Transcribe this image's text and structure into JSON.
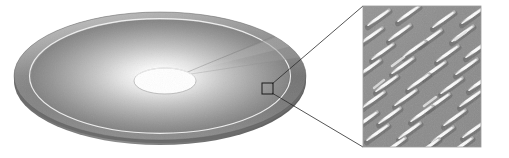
{
  "figure": {
    "caption": "",
    "background_color": "#ffffff",
    "width": 509,
    "height": 158
  },
  "disc": {
    "label": "optical disc",
    "center_x": 160,
    "center_y": 76,
    "radius_x": 146,
    "radius_y": 64,
    "edge_thickness": 5,
    "rim": {
      "label": "outer rim band",
      "color_dark": "#6e6e6e",
      "color_light": "#9a9a9a",
      "inner_ratio": 0.88
    },
    "track_ring": {
      "label": "lead-in ring line",
      "color": "#f2f2f2",
      "radius_ratio": 0.87,
      "stroke_width": 1
    },
    "surface": {
      "label": "recording surface",
      "color_highlight": "#fcfcfc",
      "color_mid": "#c8c8c8",
      "color_edge": "#7a7a7a"
    },
    "hub_hole": {
      "label": "center spindle hole",
      "center_x": 165,
      "center_y": 81,
      "radius_x": 31,
      "radius_y": 13,
      "fill": "#ffffff",
      "stroke": "#b8b8b8"
    },
    "sector_wedge": {
      "label": "highlighted data sector",
      "fill": "#b4b4b4",
      "opacity": 0.55
    }
  },
  "callout": {
    "marker": {
      "label": "magnified region marker",
      "x": 262,
      "y": 83,
      "width": 11,
      "height": 11,
      "stroke": "#1a1a1a",
      "fill": "none"
    },
    "leader_lines": {
      "label": "callout leader lines",
      "stroke": "#2a2a2a",
      "stroke_width": 0.8
    }
  },
  "inset": {
    "label": "electron micrograph of recorded marks",
    "x": 363,
    "y": 6,
    "width": 118,
    "height": 141,
    "background_color": "#8e8e8e",
    "mark_color": "#f0f0f0",
    "mark_shadow_color": "#646464",
    "border_color": "#9a9a9a",
    "pattern": {
      "type": "diagonal recorded marks",
      "mark_angle_deg": -45,
      "rows": 9,
      "columns": 5,
      "mark_length": 22,
      "mark_width": 3.2,
      "row_spacing": 16,
      "column_spacing": 26
    }
  },
  "accent_colors": {
    "ink": "#1a1a1a",
    "gray_dark": "#6e6e6e",
    "gray_mid": "#9a9a9a",
    "gray_light": "#d4d4d4",
    "paper": "#ffffff"
  }
}
